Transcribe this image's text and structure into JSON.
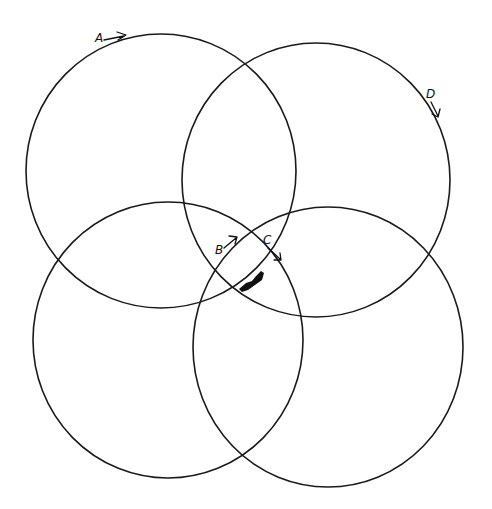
{
  "diagram": {
    "type": "four overlapping hand-drawn circles",
    "circles": [
      {
        "id": "top-left",
        "cx": 161,
        "cy": 171,
        "rx": 135,
        "ry": 137
      },
      {
        "id": "top-right",
        "cx": 316,
        "cy": 180,
        "rx": 134,
        "ry": 137
      },
      {
        "id": "bottom-left",
        "cx": 168,
        "cy": 340,
        "rx": 135,
        "ry": 138
      },
      {
        "id": "bottom-right",
        "cx": 328,
        "cy": 347,
        "rx": 135,
        "ry": 140
      }
    ],
    "labels": {
      "a": "A",
      "b": "B",
      "c": "C",
      "d": "D"
    },
    "marks": [
      "filled ink blot near central intersection"
    ]
  }
}
